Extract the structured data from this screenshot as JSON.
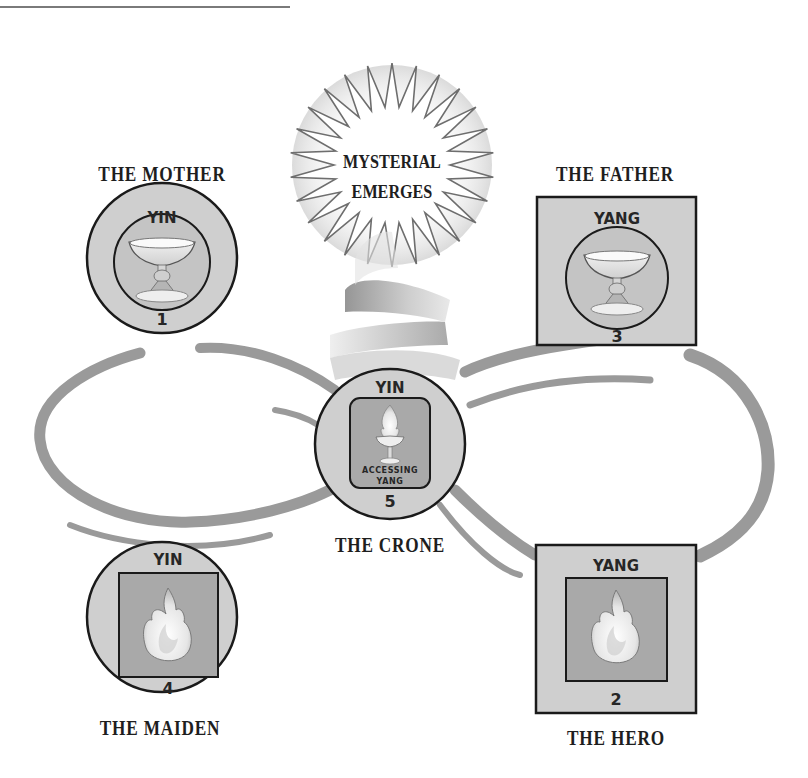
{
  "diagram": {
    "center_burst": {
      "line1": "MYSTERIAL",
      "line2": "EMERGES"
    },
    "nodes": [
      {
        "id": 1,
        "title": "THE MOTHER",
        "polarity": "YIN",
        "number": "1",
        "shape": "circle",
        "symbol": "chalice-icon",
        "symbol_frame": "circle"
      },
      {
        "id": 2,
        "title": "THE HERO",
        "polarity": "YANG",
        "number": "2",
        "shape": "square",
        "symbol": "flame-icon",
        "symbol_frame": "square"
      },
      {
        "id": 3,
        "title": "THE FATHER",
        "polarity": "YANG",
        "number": "3",
        "shape": "square",
        "symbol": "chalice-icon",
        "symbol_frame": "circle"
      },
      {
        "id": 4,
        "title": "THE MAIDEN",
        "polarity": "YIN",
        "number": "4",
        "shape": "circle",
        "symbol": "flame-icon",
        "symbol_frame": "square"
      },
      {
        "id": 5,
        "title": "THE CRONE",
        "polarity": "YIN",
        "number": "5",
        "shape": "circle",
        "symbol": "flaming-chalice-icon",
        "symbol_frame": "rounded-square",
        "symbol_caption_1": "ACCESSING",
        "symbol_caption_2": "YANG"
      }
    ],
    "connector": "infinity-loop",
    "colors": {
      "node_fill": "#cfcfcf",
      "inner_fill": "#a9a9a9",
      "loop": "#9a9a9a",
      "outline": "#1a1a1a",
      "text": "#1e1e1e"
    }
  }
}
